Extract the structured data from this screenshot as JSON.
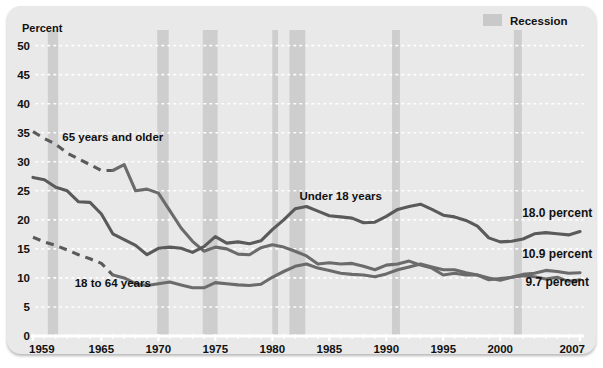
{
  "figure": {
    "y_axis_title": "Percent",
    "legend": {
      "label": "Recession",
      "swatch_color": "#c9c9c9"
    },
    "background": "#e9e9e9",
    "series_label_older": "65 years and older",
    "series_label_under18": "Under 18 years",
    "series_label_1864": "18 to 64 years",
    "endlabel_under18": "18.0 percent",
    "endlabel_older": "10.9 percent",
    "endlabel_1864": "9.7 percent"
  },
  "chart_data": {
    "type": "line",
    "title": "",
    "xlabel": "",
    "ylabel": "Percent",
    "xlim": [
      1959,
      2007
    ],
    "ylim": [
      0,
      52
    ],
    "yticks": [
      0,
      5,
      10,
      15,
      20,
      25,
      30,
      35,
      40,
      45,
      50
    ],
    "xticks": [
      1959,
      1965,
      1970,
      1975,
      1980,
      1985,
      1990,
      1995,
      2000,
      2007
    ],
    "grid": "horizontal-dotted",
    "legend_position": "top-right",
    "line_color": "#6b6b6b",
    "line_color_dark": "#5a5a5a",
    "annotations": [
      {
        "text": "65 years and older",
        "x": 1966,
        "y": 33.5
      },
      {
        "text": "Under 18 years",
        "x": 1986,
        "y": 23.5
      },
      {
        "text": "18 to 64 years",
        "x": 1966,
        "y": 8.5
      },
      {
        "text": "18.0 percent",
        "x": 2005,
        "y": 20.5
      },
      {
        "text": "10.9 percent",
        "x": 2005,
        "y": 13.5
      },
      {
        "text": "9.7 percent",
        "x": 2005,
        "y": 8.6
      }
    ],
    "recessions": [
      {
        "start": 1960.3,
        "end": 1961.2
      },
      {
        "start": 1969.9,
        "end": 1970.9
      },
      {
        "start": 1973.9,
        "end": 1975.2
      },
      {
        "start": 1980.0,
        "end": 1980.5
      },
      {
        "start": 1981.5,
        "end": 1982.9
      },
      {
        "start": 1990.5,
        "end": 1991.2
      },
      {
        "start": 2001.2,
        "end": 2001.9
      }
    ],
    "series": [
      {
        "name": "65 years and older",
        "dashed_from": 1959,
        "dashed_to": 1966,
        "x": [
          1959,
          1960,
          1961,
          1962,
          1963,
          1964,
          1965,
          1966,
          1967,
          1968,
          1969,
          1970,
          1971,
          1972,
          1973,
          1974,
          1975,
          1976,
          1977,
          1978,
          1979,
          1980,
          1981,
          1982,
          1983,
          1984,
          1985,
          1986,
          1987,
          1988,
          1989,
          1990,
          1991,
          1992,
          1993,
          1994,
          1995,
          1996,
          1997,
          1998,
          1999,
          2000,
          2001,
          2002,
          2003,
          2004,
          2005,
          2006,
          2007
        ],
        "values": [
          35.2,
          34.0,
          33.0,
          31.5,
          30.5,
          29.5,
          28.5,
          28.5,
          29.5,
          25.0,
          25.3,
          24.6,
          21.6,
          18.6,
          16.3,
          14.6,
          15.3,
          15.0,
          14.1,
          14.0,
          15.2,
          15.7,
          15.3,
          14.6,
          13.8,
          12.4,
          12.6,
          12.4,
          12.5,
          12.0,
          11.4,
          12.2,
          12.4,
          12.9,
          12.2,
          11.7,
          10.5,
          10.8,
          10.5,
          10.5,
          9.7,
          9.9,
          10.1,
          10.4,
          10.2,
          9.8,
          10.1,
          9.4,
          9.7
        ]
      },
      {
        "name": "Under 18 years",
        "dashed_from": null,
        "dashed_to": null,
        "x": [
          1959,
          1960,
          1961,
          1962,
          1963,
          1964,
          1965,
          1966,
          1967,
          1968,
          1969,
          1970,
          1971,
          1972,
          1973,
          1974,
          1975,
          1976,
          1977,
          1978,
          1979,
          1980,
          1981,
          1982,
          1983,
          1984,
          1985,
          1986,
          1987,
          1988,
          1989,
          1990,
          1991,
          1992,
          1993,
          1994,
          1995,
          1996,
          1997,
          1998,
          1999,
          2000,
          2001,
          2002,
          2003,
          2004,
          2005,
          2006,
          2007
        ],
        "values": [
          27.3,
          26.9,
          25.6,
          25.0,
          23.1,
          23.0,
          21.0,
          17.6,
          16.6,
          15.6,
          14.0,
          15.1,
          15.3,
          15.1,
          14.4,
          15.4,
          17.1,
          16.0,
          16.2,
          15.9,
          16.4,
          18.3,
          20.0,
          21.9,
          22.3,
          21.5,
          20.7,
          20.5,
          20.3,
          19.5,
          19.6,
          20.6,
          21.8,
          22.3,
          22.7,
          21.8,
          20.8,
          20.5,
          19.9,
          18.9,
          16.9,
          16.2,
          16.3,
          16.7,
          17.6,
          17.8,
          17.6,
          17.4,
          18.0
        ]
      },
      {
        "name": "18 to 64 years",
        "dashed_from": 1959,
        "dashed_to": 1966,
        "x": [
          1959,
          1960,
          1961,
          1962,
          1963,
          1964,
          1965,
          1966,
          1967,
          1968,
          1969,
          1970,
          1971,
          1972,
          1973,
          1974,
          1975,
          1976,
          1977,
          1978,
          1979,
          1980,
          1981,
          1982,
          1983,
          1984,
          1985,
          1986,
          1987,
          1988,
          1989,
          1990,
          1991,
          1992,
          1993,
          1994,
          1995,
          1996,
          1997,
          1998,
          1999,
          2000,
          2001,
          2002,
          2003,
          2004,
          2005,
          2006,
          2007
        ],
        "values": [
          17.0,
          16.2,
          15.6,
          14.8,
          14.0,
          13.3,
          12.5,
          10.5,
          10.0,
          9.0,
          8.7,
          9.0,
          9.3,
          8.8,
          8.3,
          8.3,
          9.2,
          9.0,
          8.8,
          8.7,
          8.9,
          10.1,
          11.1,
          12.0,
          12.4,
          11.7,
          11.3,
          10.8,
          10.6,
          10.5,
          10.2,
          10.7,
          11.4,
          11.9,
          12.4,
          11.9,
          11.4,
          11.4,
          10.9,
          10.5,
          10.0,
          9.6,
          10.1,
          10.6,
          10.8,
          11.3,
          11.1,
          10.8,
          10.9
        ]
      }
    ]
  }
}
